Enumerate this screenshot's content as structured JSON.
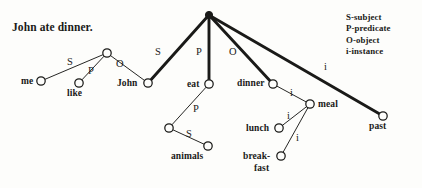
{
  "figure": {
    "caption": "John ate dinner.",
    "background_color": "#fdfdfb",
    "ink_color": "#1a1a18"
  },
  "legend": {
    "entries": [
      {
        "label": "S-subject"
      },
      {
        "label": "P-predicate"
      },
      {
        "label": "O-object"
      },
      {
        "label": "i-instance"
      }
    ]
  },
  "graph": {
    "type": "semantic-network",
    "nodes": [
      {
        "id": "hub",
        "label": "",
        "x": 209,
        "y": 15,
        "style": "filled",
        "r": 3.6,
        "label_x": 0,
        "label_y": 0,
        "label_anchor": "none"
      },
      {
        "id": "relhub",
        "label": "",
        "x": 107,
        "y": 53,
        "style": "hollow",
        "r": 4.2,
        "label_x": 0,
        "label_y": 0,
        "label_anchor": "none"
      },
      {
        "id": "me",
        "label": "me",
        "x": 41,
        "y": 81,
        "style": "hollow",
        "r": 4.2,
        "label_x": 21,
        "label_y": 77,
        "label_anchor": "left"
      },
      {
        "id": "like",
        "label": "like",
        "x": 79,
        "y": 83,
        "style": "hollow",
        "r": 4.2,
        "label_x": 67,
        "label_y": 89,
        "label_anchor": "left"
      },
      {
        "id": "john",
        "label": "John",
        "x": 148,
        "y": 83,
        "style": "hollow",
        "r": 4.2,
        "label_x": 117,
        "label_y": 79,
        "label_anchor": "left"
      },
      {
        "id": "eat",
        "label": "eat",
        "x": 209,
        "y": 84,
        "style": "hollow",
        "r": 4.2,
        "label_x": 187,
        "label_y": 80,
        "label_anchor": "left"
      },
      {
        "id": "eatrel",
        "label": "",
        "x": 169,
        "y": 128,
        "style": "hollow",
        "r": 4.2,
        "label_x": 0,
        "label_y": 0,
        "label_anchor": "none"
      },
      {
        "id": "animals",
        "label": "animals",
        "x": 208,
        "y": 146,
        "style": "hollow",
        "r": 4.2,
        "label_x": 171,
        "label_y": 152,
        "label_anchor": "left"
      },
      {
        "id": "dinner",
        "label": "dinner",
        "x": 273,
        "y": 84,
        "style": "hollow",
        "r": 4.2,
        "label_x": 237,
        "label_y": 79,
        "label_anchor": "left"
      },
      {
        "id": "meal",
        "label": "meal",
        "x": 310,
        "y": 104,
        "style": "hollow",
        "r": 4.2,
        "label_x": 318,
        "label_y": 100,
        "label_anchor": "left"
      },
      {
        "id": "lunch",
        "label": "lunch",
        "x": 279,
        "y": 128,
        "style": "hollow",
        "r": 4.2,
        "label_x": 246,
        "label_y": 124,
        "label_anchor": "left"
      },
      {
        "id": "breakfast",
        "label": "break-",
        "x": 281,
        "y": 156,
        "style": "hollow",
        "r": 4.2,
        "label_x": 243,
        "label_y": 152,
        "label_anchor": "left"
      },
      {
        "id": "past",
        "label": "past",
        "x": 383,
        "y": 116,
        "style": "hollow",
        "r": 4.2,
        "label_x": 369,
        "label_y": 122,
        "label_anchor": "left"
      }
    ],
    "node_label_extra": [
      {
        "id": "breakfast-2",
        "label": "fast",
        "x": 254,
        "y": 164
      }
    ],
    "edges": [
      {
        "id": "e-hub-john",
        "from": "hub",
        "to": "john",
        "label": "S",
        "thick": true,
        "label_x": 155,
        "label_y": 47
      },
      {
        "id": "e-hub-eat",
        "from": "hub",
        "to": "eat",
        "label": "P",
        "thick": true,
        "label_x": 196,
        "label_y": 47
      },
      {
        "id": "e-hub-dinner",
        "from": "hub",
        "to": "dinner",
        "label": "O",
        "thick": true,
        "label_x": 229,
        "label_y": 47
      },
      {
        "id": "e-hub-past",
        "from": "hub",
        "to": "past",
        "label": "i",
        "thick": true,
        "label_x": 324,
        "label_y": 62
      },
      {
        "id": "e-relhub-me",
        "from": "relhub",
        "to": "me",
        "label": "S",
        "thick": false,
        "label_x": 67,
        "label_y": 57
      },
      {
        "id": "e-relhub-like",
        "from": "relhub",
        "to": "like",
        "label": "P",
        "thick": false,
        "label_x": 88,
        "label_y": 66
      },
      {
        "id": "e-relhub-john",
        "from": "relhub",
        "to": "john",
        "label": "O",
        "thick": false,
        "label_x": 116,
        "label_y": 59
      },
      {
        "id": "e-eat-eatrel",
        "from": "eat",
        "to": "eatrel",
        "label": "P",
        "thick": false,
        "label_x": 193,
        "label_y": 104
      },
      {
        "id": "e-eatrel-animals",
        "from": "eatrel",
        "to": "animals",
        "label": "S",
        "thick": false,
        "label_x": 186,
        "label_y": 129
      },
      {
        "id": "e-dinner-meal",
        "from": "dinner",
        "to": "meal",
        "label": "i",
        "thick": false,
        "label_x": 290,
        "label_y": 88
      },
      {
        "id": "e-lunch-meal",
        "from": "lunch",
        "to": "meal",
        "label": "i",
        "thick": false,
        "label_x": 287,
        "label_y": 111
      },
      {
        "id": "e-breakfast-meal",
        "from": "breakfast",
        "to": "meal",
        "label": "i",
        "thick": false,
        "label_x": 296,
        "label_y": 133
      }
    ]
  }
}
